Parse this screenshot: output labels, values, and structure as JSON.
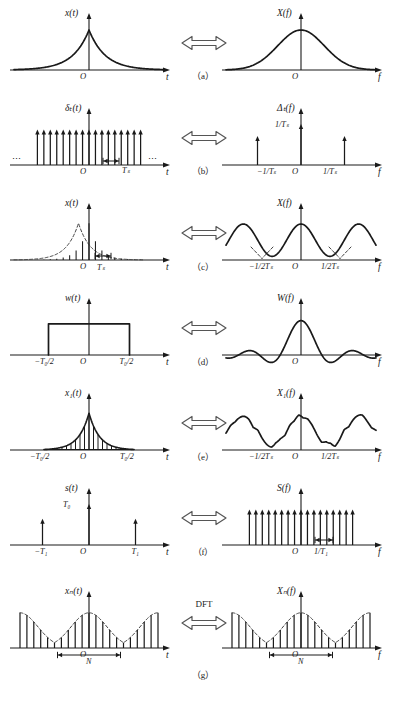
{
  "figure": {
    "arrow_symbol": "⇔",
    "origin_label": "O",
    "ellipsis": "⋯"
  },
  "rows": [
    {
      "id": "a",
      "caption": "（a）",
      "arrow_caption": "",
      "left": {
        "name": "continuous-signal",
        "ylabel": "x(t)",
        "xlabel": "t",
        "origin": "O",
        "ticks": [],
        "amp": "",
        "dots_left": "",
        "dots_right": "",
        "shape": "two-sided-exponential"
      },
      "right": {
        "name": "continuous-spectrum",
        "ylabel": "X(f)",
        "xlabel": "f",
        "origin": "O",
        "ticks": [],
        "amp": "",
        "dots_left": "",
        "dots_right": "",
        "shape": "lorentzian-bump"
      }
    },
    {
      "id": "b",
      "caption": "（b）",
      "arrow_caption": "",
      "left": {
        "name": "impulse-train-time",
        "ylabel": "δₜ(t)",
        "xlabel": "t",
        "origin": "O",
        "ticks": [
          "Tₛ"
        ],
        "amp": "",
        "dots_left": "⋯",
        "dots_right": "⋯",
        "shape": "dense-impulse-train"
      },
      "right": {
        "name": "impulse-train-freq",
        "ylabel": "Δₜ(f)",
        "xlabel": "f",
        "origin": "O",
        "ticks": [
          "−1/Tₛ",
          "1/Tₛ"
        ],
        "amp": "1/Tₛ",
        "dots_left": "",
        "dots_right": "",
        "shape": "three-impulses"
      }
    },
    {
      "id": "c",
      "caption": "（c）",
      "arrow_caption": "",
      "left": {
        "name": "sampled-signal",
        "ylabel": "x(t)",
        "xlabel": "t",
        "origin": "O",
        "ticks": [
          "Tₛ"
        ],
        "amp": "",
        "dots_left": "",
        "dots_right": "",
        "shape": "sampled-exponential"
      },
      "right": {
        "name": "periodic-spectrum",
        "ylabel": "X(f)",
        "xlabel": "f",
        "origin": "O",
        "ticks": [
          "−1/2Tₛ",
          "1/2Tₛ"
        ],
        "amp": "",
        "dots_left": "",
        "dots_right": "",
        "shape": "aliased-periodic"
      }
    },
    {
      "id": "d",
      "caption": "（d）",
      "arrow_caption": "",
      "left": {
        "name": "rectangular-window",
        "ylabel": "w(t)",
        "xlabel": "t",
        "origin": "O",
        "ticks": [
          "−T₀/2",
          "T₀/2"
        ],
        "amp": "",
        "dots_left": "",
        "dots_right": "",
        "shape": "rectangle"
      },
      "right": {
        "name": "sinc-spectrum",
        "ylabel": "W(f)",
        "xlabel": "f",
        "origin": "O",
        "ticks": [],
        "amp": "",
        "dots_left": "",
        "dots_right": "",
        "shape": "sinc"
      }
    },
    {
      "id": "e",
      "caption": "（e）",
      "arrow_caption": "",
      "left": {
        "name": "windowed-sampled-signal",
        "ylabel": "x₁(t)",
        "xlabel": "t",
        "origin": "O",
        "ticks": [
          "−T₀/2",
          "T₀/2"
        ],
        "amp": "",
        "dots_left": "",
        "dots_right": "",
        "shape": "truncated-sampled-exponential"
      },
      "right": {
        "name": "smeared-spectrum",
        "ylabel": "X₁(f)",
        "xlabel": "f",
        "origin": "O",
        "ticks": [
          "−1/2Tₛ",
          "1/2Tₛ"
        ],
        "amp": "",
        "dots_left": "",
        "dots_right": "",
        "shape": "rippled-periodic"
      }
    },
    {
      "id": "f",
      "caption": "（f）",
      "arrow_caption": "",
      "left": {
        "name": "sparse-impulse-train-time",
        "ylabel": "s(t)",
        "xlabel": "t",
        "origin": "O",
        "ticks": [
          "−T₁",
          "T₁"
        ],
        "amp": "T₀",
        "dots_left": "",
        "dots_right": "",
        "shape": "three-impulses-wide"
      },
      "right": {
        "name": "dense-impulse-train-freq",
        "ylabel": "S(f)",
        "xlabel": "f",
        "origin": "O",
        "ticks": [
          "1/T₁"
        ],
        "amp": "",
        "dots_left": "",
        "dots_right": "",
        "shape": "dense-impulse-train"
      }
    },
    {
      "id": "g",
      "caption": "（g）",
      "arrow_caption": "DFT",
      "left": {
        "name": "discrete-periodic-sequence",
        "ylabel": "xₙ(t)",
        "xlabel": "t",
        "origin": "O",
        "ticks": [
          "N"
        ],
        "amp": "",
        "dots_left": "",
        "dots_right": "",
        "shape": "dft-sequence"
      },
      "right": {
        "name": "discrete-periodic-spectrum",
        "ylabel": "Xₙ(f)",
        "xlabel": "f",
        "origin": "O",
        "ticks": [
          "N"
        ],
        "amp": "",
        "dots_left": "",
        "dots_right": "",
        "shape": "dft-sequence"
      }
    }
  ],
  "chart_data": {
    "type": "line",
    "xlabel": "t / f",
    "ylabel": "amplitude",
    "panels": [
      {
        "row": "a",
        "side": "left",
        "signal": "x(t)",
        "form": "two-sided exponential e^{-a|t|}",
        "domain": "time",
        "x_ticks": [
          "O"
        ],
        "peak": 1.0
      },
      {
        "row": "a",
        "side": "right",
        "signal": "X(f)",
        "form": "Lorentzian 2a/(a^2+(2*pi*f)^2)",
        "domain": "frequency",
        "x_ticks": [
          "O"
        ],
        "peak": 1.0
      },
      {
        "row": "b",
        "side": "left",
        "signal": "delta_T(t)",
        "form": "impulse train, period T_s",
        "domain": "time",
        "x_ticks": [
          "O",
          "T_s"
        ],
        "impulse_count": 17,
        "peak": 1.0
      },
      {
        "row": "b",
        "side": "right",
        "signal": "Delta_T(f)",
        "form": "impulse train, period 1/T_s",
        "domain": "frequency",
        "x_ticks": [
          "-1/T_s",
          "O",
          "1/T_s"
        ],
        "impulse_count": 3,
        "peak": 1.0,
        "amplitude_label": "1/T_s"
      },
      {
        "row": "c",
        "side": "left",
        "signal": "x(t) sampled",
        "form": "exponential envelope sampled at T_s",
        "domain": "time",
        "x_ticks": [
          "O",
          "T_s"
        ],
        "sample_count": 17
      },
      {
        "row": "c",
        "side": "right",
        "signal": "X(f) periodic",
        "form": "periodic replication, period 1/T_s",
        "domain": "frequency",
        "x_ticks": [
          "-1/2T_s",
          "O",
          "1/2T_s"
        ],
        "periods": 2.5
      },
      {
        "row": "d",
        "side": "left",
        "signal": "w(t)",
        "form": "rectangle of width T_0",
        "domain": "time",
        "x_ticks": [
          "-T_0/2",
          "O",
          "T_0/2"
        ],
        "peak": 1.0
      },
      {
        "row": "d",
        "side": "right",
        "signal": "W(f)",
        "form": "sinc(pi f T_0)",
        "domain": "frequency",
        "x_ticks": [
          "O"
        ],
        "peak": 1.0,
        "sidelobes": 3
      },
      {
        "row": "e",
        "side": "left",
        "signal": "x_1(t)",
        "form": "sampled exponential truncated to [-T_0/2, T_0/2]",
        "domain": "time",
        "x_ticks": [
          "-T_0/2",
          "O",
          "T_0/2"
        ],
        "sample_count": 21
      },
      {
        "row": "e",
        "side": "right",
        "signal": "X_1(f)",
        "form": "periodic spectrum convolved with sinc (leakage ripple)",
        "domain": "frequency",
        "x_ticks": [
          "-1/2T_s",
          "O",
          "1/2T_s"
        ]
      },
      {
        "row": "f",
        "side": "left",
        "signal": "s(t)",
        "form": "impulse train, period T_1, height T_0",
        "domain": "time",
        "x_ticks": [
          "-T_1",
          "O",
          "T_1"
        ],
        "impulse_count": 3,
        "amplitude_label": "T_0"
      },
      {
        "row": "f",
        "side": "right",
        "signal": "S(f)",
        "form": "impulse train, spacing 1/T_1",
        "domain": "frequency",
        "x_ticks": [
          "O",
          "1/T_1"
        ],
        "impulse_count": 21
      },
      {
        "row": "g",
        "side": "left",
        "signal": "x_N(t)",
        "form": "periodic discrete sequence, N samples per period",
        "domain": "time",
        "x_ticks": [
          "O",
          "N"
        ],
        "sample_count": 21
      },
      {
        "row": "g",
        "side": "right",
        "signal": "X_N(f)",
        "form": "periodic discrete spectrum, N samples per period",
        "domain": "frequency",
        "x_ticks": [
          "O",
          "N"
        ],
        "sample_count": 21
      }
    ],
    "relations": [
      {
        "pair": "a",
        "operation": "Fourier transform"
      },
      {
        "pair": "b",
        "operation": "Fourier transform"
      },
      {
        "pair": "c",
        "operation": "multiplication in time = convolution in frequency"
      },
      {
        "pair": "d",
        "operation": "Fourier transform"
      },
      {
        "pair": "e",
        "operation": "windowing: convolution with sinc"
      },
      {
        "pair": "f",
        "operation": "Fourier transform"
      },
      {
        "pair": "g",
        "operation": "DFT"
      }
    ]
  }
}
